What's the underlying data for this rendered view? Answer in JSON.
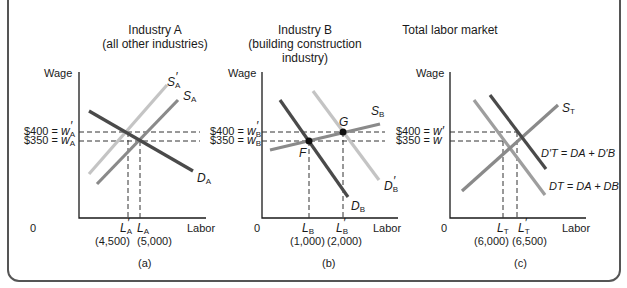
{
  "panels": [
    {
      "id": "a",
      "title_line1": "Industry A",
      "title_line2": "(all other industries)",
      "y_axis_label": "Wage",
      "x_axis_label": "Labor",
      "origin": "0",
      "wage_high_label": "$400 = ",
      "wage_high_sym": "w",
      "wage_high_sub": "A",
      "wage_low_label": "$350 = ",
      "wage_low_sym": "w",
      "wage_low_sub": "A",
      "qty1_sym": "L",
      "qty1_sub": "A",
      "qty1_value": "(4,500)",
      "qty2_sym": "L",
      "qty2_sub": "A",
      "qty2_value": "(5,000)",
      "curves": {
        "supply_prime": {
          "sym": "S",
          "sub": "A",
          "prime": true
        },
        "supply": {
          "sym": "S",
          "sub": "A"
        },
        "demand": {
          "sym": "D",
          "sub": "A"
        }
      },
      "caption": "(a)"
    },
    {
      "id": "b",
      "title_line1": "Industry B",
      "title_line2": "(building construction",
      "title_line3": "industry)",
      "y_axis_label": "Wage",
      "x_axis_label": "Labor",
      "origin": "0",
      "wage_high_label": "$400 = ",
      "wage_high_sym": "w",
      "wage_high_sub": "B",
      "wage_low_label": "$350 = ",
      "wage_low_sym": "w",
      "wage_low_sub": "B",
      "qty1_sym": "L",
      "qty1_sub": "B",
      "qty1_value": "(1,000)",
      "qty2_sym": "L",
      "qty2_sub": "B",
      "qty2_value": "(2,000)",
      "points": {
        "F": "F",
        "G": "G"
      },
      "curves": {
        "supply": {
          "sym": "S",
          "sub": "B"
        },
        "demand": {
          "sym": "D",
          "sub": "B"
        },
        "demand_prime": {
          "sym": "D",
          "sub": "B",
          "prime": true
        }
      },
      "caption": "(b)"
    },
    {
      "id": "c",
      "title_line1": "Total labor market",
      "y_axis_label": "Wage",
      "x_axis_label": "Labor",
      "origin": "0",
      "wage_high_label": "$400 = ",
      "wage_high_sym": "w′",
      "wage_low_label": "$350 = ",
      "wage_low_sym": "w",
      "qty1_sym": "L",
      "qty1_sub": "T",
      "qty1_value": "(6,000)",
      "qty2_sym": "L",
      "qty2_sub": "T",
      "qty2_value": "(6,500)",
      "curves": {
        "supply": {
          "sym": "S",
          "sub": "T"
        },
        "demand_prime": {
          "label": "D′T = DA + D′B"
        },
        "demand": {
          "label": "DT = DA + DB"
        }
      },
      "caption": "(c)"
    }
  ],
  "colors": {
    "dark_line": "#4a4a4a",
    "mid_line": "#8a8a8a",
    "light_line": "#c4c4c4",
    "frame": "#555555"
  }
}
